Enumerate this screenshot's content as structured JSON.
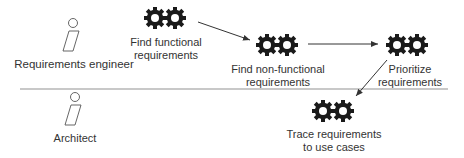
{
  "diagram": {
    "type": "activity-swimlane",
    "lanes": [
      {
        "id": "lane1",
        "actor": "Requirements engineer"
      },
      {
        "id": "lane2",
        "actor": "Architect"
      }
    ],
    "activities": [
      {
        "id": "a1",
        "lines": [
          "Find functional",
          "requirements"
        ],
        "lane": "lane1",
        "icon": "gears-icon"
      },
      {
        "id": "a2",
        "lines": [
          "Find non-functional",
          "requirements"
        ],
        "lane": "lane1",
        "icon": "gears-icon"
      },
      {
        "id": "a3",
        "lines": [
          "Prioritize",
          "requirements"
        ],
        "lane": "lane1",
        "icon": "gears-icon"
      },
      {
        "id": "a4",
        "lines": [
          "Trace requirements",
          "to use cases"
        ],
        "lane": "lane2",
        "icon": "gears-icon"
      }
    ],
    "flows": [
      {
        "from": "a1",
        "to": "a2"
      },
      {
        "from": "a2",
        "to": "a3"
      },
      {
        "from": "a3",
        "to": "a4"
      }
    ],
    "colors": {
      "gear": "#1a1a1a",
      "line": "#333333",
      "divider": "#c8c8c8",
      "actor": "#555555"
    }
  }
}
